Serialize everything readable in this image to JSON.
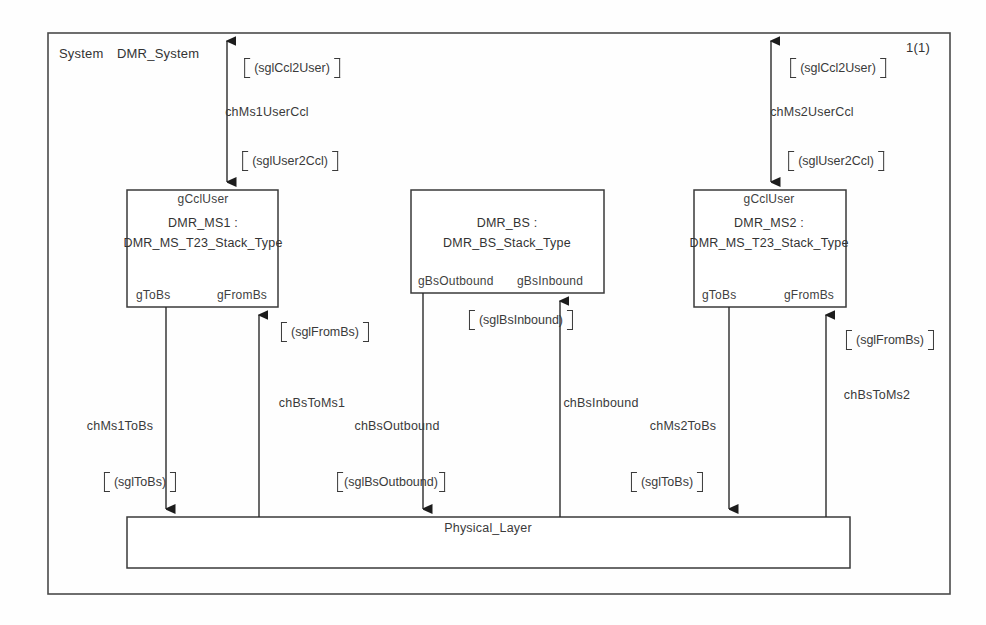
{
  "diagram": {
    "kind": "SDL system block diagram",
    "page_indicator": "1(1)",
    "system_keyword": "System",
    "system_name": "DMR_System",
    "frame": {
      "stroke": "#4a4a4a"
    }
  },
  "blocks": [
    {
      "id": "ms1",
      "top_port": "gCclUser",
      "title_line1": "DMR_MS1 :",
      "title_line2": "DMR_MS_T23_Stack_Type",
      "bottom_port_left": "gToBs",
      "bottom_port_right": "gFromBs"
    },
    {
      "id": "bs",
      "top_port": "",
      "title_line1": "DMR_BS :",
      "title_line2": "DMR_BS_Stack_Type",
      "bottom_port_left": "gBsOutbound",
      "bottom_port_right": "gBsInbound"
    },
    {
      "id": "ms2",
      "top_port": "gCclUser",
      "title_line1": "DMR_MS2 :",
      "title_line2": "DMR_MS_T23_Stack_Type",
      "bottom_port_left": "gToBs",
      "bottom_port_right": "gFromBs"
    }
  ],
  "physical_layer": {
    "label": "Physical_Layer"
  },
  "channels": [
    {
      "id": "chMs1UserCcl",
      "name": "chMs1UserCcl",
      "signal_up": "(sglCcl2User)",
      "signal_down": "(sglUser2Ccl)"
    },
    {
      "id": "chMs2UserCcl",
      "name": "chMs2UserCcl",
      "signal_up": "(sglCcl2User)",
      "signal_down": "(sglUser2Ccl)"
    },
    {
      "id": "chMs1ToBs",
      "name": "chMs1ToBs",
      "signal_down": "(sglToBs)"
    },
    {
      "id": "chBsToMs1",
      "name": "chBsToMs1",
      "signal_up": "(sglFromBs)"
    },
    {
      "id": "chBsOutbound",
      "name": "chBsOutbound",
      "signal_down": "(sglBsOutbound)"
    },
    {
      "id": "chBsInbound",
      "name": "chBsInbound",
      "signal_up": "(sglBsInbound)"
    },
    {
      "id": "chMs2ToBs",
      "name": "chMs2ToBs",
      "signal_down": "(sglToBs)"
    },
    {
      "id": "chBsToMs2",
      "name": "chBsToMs2",
      "signal_up": "(sglFromBs)"
    }
  ],
  "labels": {
    "sig_ccl2user_left": "(sglCcl2User)",
    "sig_user2ccl_left": "(sglUser2Ccl)",
    "sig_ccl2user_right": "(sglCcl2User)",
    "sig_user2ccl_right": "(sglUser2Ccl)",
    "sig_fromBs_left": "(sglFromBs)",
    "sig_bsInbound": "(sglBsInbound)",
    "sig_fromBs_right": "(sglFromBs)",
    "sig_toBs_left": "(sglToBs)",
    "sig_bsOutbound": "(sglBsOutbound)",
    "sig_toBs_right": "(sglToBs)",
    "ch_ms1UserCcl": "chMs1UserCcl",
    "ch_ms2UserCcl": "chMs2UserCcl",
    "ch_ms1ToBs": "chMs1ToBs",
    "ch_bsToMs1": "chBsToMs1",
    "ch_bsOutbound": "chBsOutbound",
    "ch_bsInbound": "chBsInbound",
    "ch_ms2ToBs": "chMs2ToBs",
    "ch_bsToMs2": "chBsToMs2"
  }
}
